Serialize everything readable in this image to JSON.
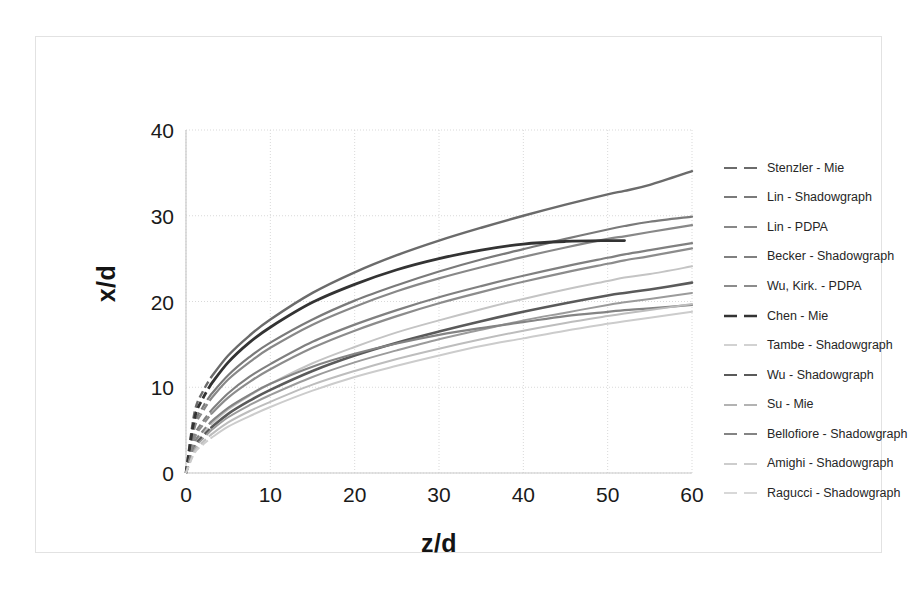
{
  "figure": {
    "background": "#ffffff",
    "frame_color": "#e2e2e2"
  },
  "chart_data": {
    "type": "line",
    "title": "",
    "subtitle": "",
    "xlabel": "z/d",
    "ylabel": "x/d",
    "xlim": [
      0,
      60
    ],
    "ylim": [
      0,
      40
    ],
    "xticks": [
      "0",
      "10",
      "20",
      "30",
      "40",
      "50",
      "60"
    ],
    "yticks": [
      "0",
      "10",
      "20",
      "30",
      "40"
    ],
    "xtick_values": [
      0,
      10,
      20,
      30,
      40,
      50,
      60
    ],
    "ytick_values": [
      0,
      10,
      20,
      30,
      40
    ],
    "grid": true,
    "grid_color": "#d9d9d9",
    "legend_position": "right",
    "x_sample": [
      0,
      1,
      2,
      3,
      5,
      7.5,
      10,
      15,
      20,
      25,
      30,
      35,
      40,
      45,
      50,
      52,
      55,
      60
    ],
    "series": [
      {
        "name": "Stenzler - Mie",
        "color": "#6b6b6b",
        "width": 2.4,
        "dash_head": true,
        "x_end": 60,
        "values": [
          0,
          7.0,
          9.5,
          11.2,
          13.7,
          16.0,
          17.9,
          21.0,
          23.4,
          25.4,
          27.1,
          28.6,
          30.0,
          31.3,
          32.5,
          32.9,
          33.6,
          35.2
        ]
      },
      {
        "name": "Lin - Shadowgraph",
        "color": "#7a7a7a",
        "width": 2.2,
        "dash_head": true,
        "x_end": 60,
        "values": [
          0,
          5.6,
          7.7,
          9.2,
          11.4,
          13.5,
          15.2,
          17.9,
          20.1,
          21.9,
          23.5,
          24.9,
          26.1,
          27.3,
          28.4,
          28.8,
          29.3,
          29.9
        ]
      },
      {
        "name": "Lin - PDPA",
        "color": "#888888",
        "width": 2.2,
        "dash_head": true,
        "x_end": 60,
        "values": [
          0,
          5.2,
          7.2,
          8.7,
          10.9,
          12.9,
          14.6,
          17.3,
          19.4,
          21.2,
          22.7,
          24.0,
          25.2,
          26.3,
          27.3,
          27.6,
          28.1,
          28.9
        ]
      },
      {
        "name": "Becker - Shadowgraph",
        "color": "#808080",
        "width": 2.2,
        "dash_head": true,
        "x_end": 60,
        "values": [
          0,
          4.3,
          6.0,
          7.3,
          9.3,
          11.2,
          12.7,
          15.3,
          17.3,
          19.0,
          20.5,
          21.8,
          23.0,
          24.1,
          25.1,
          25.5,
          26.0,
          26.8
        ]
      },
      {
        "name": "Wu, Kirk. - PDPA",
        "color": "#8c8c8c",
        "width": 2.2,
        "dash_head": true,
        "x_end": 60,
        "values": [
          0,
          4.0,
          5.6,
          6.9,
          8.8,
          10.6,
          12.1,
          14.6,
          16.6,
          18.3,
          19.8,
          21.1,
          22.3,
          23.4,
          24.4,
          24.8,
          25.3,
          26.2
        ]
      },
      {
        "name": "Chen - Mie",
        "color": "#333333",
        "width": 2.8,
        "dash_head": true,
        "x_end": 52,
        "values": [
          0,
          6.3,
          8.7,
          10.4,
          12.9,
          15.2,
          17.0,
          19.9,
          22.0,
          23.7,
          25.0,
          26.0,
          26.7,
          27.0,
          27.1,
          27.1,
          null,
          null
        ]
      },
      {
        "name": "Tambe - Shadowgraph",
        "color": "#c4c4c4",
        "width": 2.0,
        "dash_head": true,
        "x_end": 60,
        "values": [
          0,
          3.2,
          4.6,
          5.7,
          7.4,
          9.0,
          10.4,
          12.8,
          14.7,
          16.4,
          17.8,
          19.1,
          20.3,
          21.4,
          22.4,
          22.8,
          23.2,
          24.1
        ]
      },
      {
        "name": "Wu - Shadowgraph",
        "color": "#5a5a5a",
        "width": 2.6,
        "dash_head": true,
        "x_end": 60,
        "values": [
          0,
          3.0,
          4.3,
          5.3,
          6.9,
          8.4,
          9.7,
          11.9,
          13.7,
          15.2,
          16.5,
          17.7,
          18.8,
          19.8,
          20.7,
          21.0,
          21.4,
          22.2
        ]
      },
      {
        "name": "Su - Mie",
        "color": "#9b9b9b",
        "width": 2.0,
        "dash_head": true,
        "x_end": 60,
        "values": [
          0,
          2.8,
          4.0,
          5.0,
          6.5,
          7.9,
          9.1,
          11.2,
          12.9,
          14.3,
          15.6,
          16.7,
          17.8,
          18.7,
          19.6,
          19.9,
          20.3,
          21.0
        ]
      },
      {
        "name": "Bellofiore - Shadowgraph",
        "color": "#848484",
        "width": 2.2,
        "dash_head": true,
        "x_end": 60,
        "values": [
          0,
          3.5,
          4.9,
          6.0,
          7.6,
          9.1,
          10.4,
          12.4,
          13.9,
          15.1,
          16.1,
          16.9,
          17.6,
          18.3,
          18.8,
          19.0,
          19.2,
          19.6
        ]
      },
      {
        "name": "Amighi - Shadowgraph",
        "color": "#bdbdbd",
        "width": 2.0,
        "dash_head": true,
        "x_end": 60,
        "values": [
          0,
          2.5,
          3.6,
          4.5,
          5.9,
          7.2,
          8.3,
          10.3,
          11.9,
          13.3,
          14.5,
          15.6,
          16.6,
          17.5,
          18.3,
          18.6,
          19.0,
          19.7
        ]
      },
      {
        "name": "Ragucci - Shadowgraph",
        "color": "#cccccc",
        "width": 2.0,
        "dash_head": true,
        "x_end": 60,
        "values": [
          0,
          2.3,
          3.3,
          4.1,
          5.4,
          6.6,
          7.7,
          9.6,
          11.2,
          12.5,
          13.7,
          14.8,
          15.7,
          16.6,
          17.4,
          17.7,
          18.1,
          18.8
        ]
      }
    ]
  },
  "axes": {
    "ylabel": "x/d",
    "xlabel": "z/d"
  }
}
